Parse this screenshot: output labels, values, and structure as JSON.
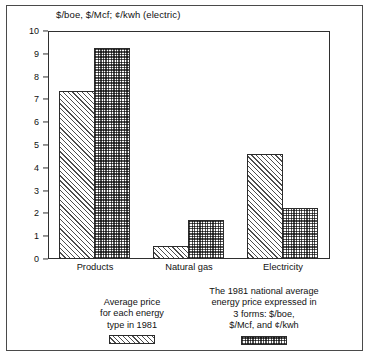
{
  "chart_data": {
    "type": "bar",
    "title": "$/boe, $/Mcf; ¢/kwh (electric)",
    "xlabel": "",
    "ylabel": "",
    "ylim": [
      0,
      10
    ],
    "yticks": [
      0,
      1,
      2,
      3,
      4,
      5,
      6,
      7,
      8,
      9,
      10
    ],
    "ytick_labels": [
      "0",
      "1",
      "2",
      "3",
      "4",
      "5",
      "6",
      "7",
      "8",
      "9",
      "10"
    ],
    "grid": false,
    "legend_position": "below-plot",
    "categories": [
      "Products",
      "Natural gas",
      "Electricity"
    ],
    "series": [
      {
        "name": "Average price for each energy type in 1981",
        "pattern": "diagonal-hatch",
        "values": [
          7.35,
          0.55,
          4.6
        ]
      },
      {
        "name": "The 1981 national average energy price expressed in 3 forms: $/boe, $/Mcf, and ¢/kwh",
        "pattern": "checkerboard",
        "values": [
          9.25,
          1.7,
          2.25
        ]
      }
    ]
  },
  "legend": {
    "items": [
      {
        "caption": "Average price\nfor each energy\ntype in 1981",
        "swatch": "hatch-swatch"
      },
      {
        "caption": "The 1981 national average\nenergy price expressed in\n3 forms: $/boe,\n$/Mcf, and ¢/kwh",
        "swatch": "checker-swatch"
      }
    ]
  },
  "colors": {
    "frame": "#4a4a4a",
    "axis": "#2f2f2f",
    "bar_outline": "#2b2b2b",
    "pattern_ink": "#4d4d4d",
    "background": "#ffffff",
    "text": "#111111"
  }
}
